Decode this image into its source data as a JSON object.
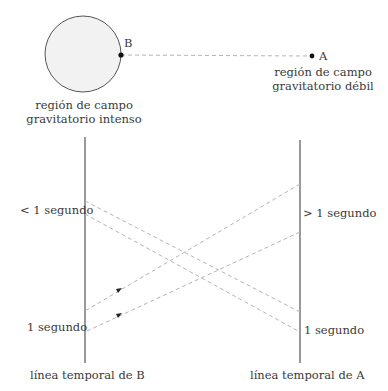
{
  "points": {
    "B": {
      "label": "B"
    },
    "A": {
      "label": "A"
    }
  },
  "regions": {
    "strong": {
      "line1": "región de campo",
      "line2": "gravitatorio intenso"
    },
    "weak": {
      "line1": "región de campo",
      "line2": "gravitatorio débil"
    }
  },
  "timelines": {
    "B": {
      "label": "línea temporal de B",
      "upper_mark": "< 1 segundo",
      "lower_mark": "1 segundo"
    },
    "A": {
      "label": "línea temporal de A",
      "upper_mark": "> 1 segundo",
      "lower_mark": "1 segundo"
    }
  },
  "colors": {
    "line": "#555555",
    "dashed": "#b5b5b5",
    "circle_fill": "#f2f2f2",
    "dot": "#111111"
  }
}
